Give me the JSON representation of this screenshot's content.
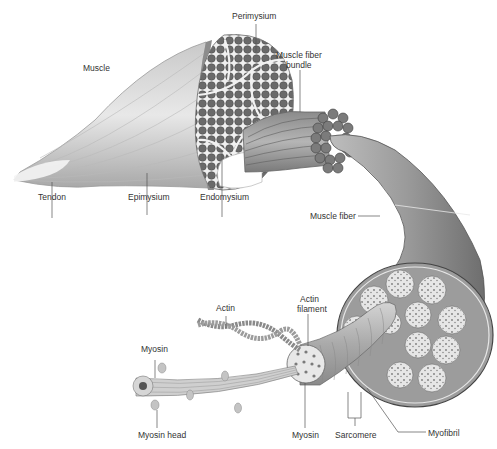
{
  "diagram": {
    "labels": {
      "perimysium": "Perimysium",
      "muscle": "Muscle",
      "muscle_fiber_bundle_1": "Muscle fiber",
      "muscle_fiber_bundle_2": "bundle",
      "tendon": "Tendon",
      "epimysium": "Epimysium",
      "endomysium": "Endomysium",
      "muscle_fiber": "Muscle fiber",
      "actin": "Actin",
      "actin_filament_1": "Actin",
      "actin_filament_2": "filament",
      "myosin_top": "Myosin",
      "myosin_head": "Myosin head",
      "myosin_bottom": "Myosin",
      "sarcomere": "Sarcomere",
      "myofibril": "Myofibril"
    },
    "colors": {
      "fiber_dark": "#6e6e6e",
      "fiber_mid": "#9a9a9a",
      "fiber_light": "#d8d8d8",
      "label_text": "#333333",
      "leader_line": "#555555"
    }
  }
}
